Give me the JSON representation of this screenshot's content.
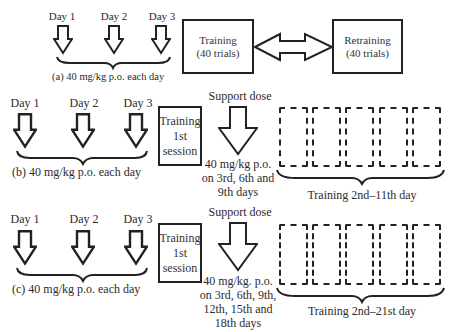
{
  "panels": [
    {
      "id": "a",
      "days": [
        "Day 1",
        "Day 2",
        "Day 3"
      ],
      "dose_caption": "(a)  40 mg/kg p.o. each day",
      "training_box": [
        "Training",
        "(40 trials)"
      ],
      "retraining_box": [
        "Retraining",
        "(40 trials)"
      ],
      "connector": "double-headed-arrow"
    },
    {
      "id": "b",
      "days": [
        "Day 1",
        "Day 2",
        "Day 3"
      ],
      "dose_caption": "(b)   40 mg/kg p.o. each day",
      "training_box": [
        "Training",
        "1st",
        "session"
      ],
      "support_label": "Support dose",
      "support_caption": [
        "40 mg/kg p.o.",
        "on 3rd, 6th and",
        "9th days"
      ],
      "dashed_box_count": 5,
      "dashed_caption": "Training 2nd–11th day"
    },
    {
      "id": "c",
      "days": [
        "Day 1",
        "Day 2",
        "Day 3"
      ],
      "dose_caption": "(c)   40 mg/kg p.o. each day",
      "training_box": [
        "Training",
        "1st",
        "session"
      ],
      "support_label": "Support dose",
      "support_caption": [
        "40 mg/kg. p.o.",
        "on 3rd, 6th, 9th,",
        "12th, 15th and",
        "18th days"
      ],
      "dashed_box_count": 5,
      "dashed_caption": "Training 2nd–21st day"
    }
  ]
}
